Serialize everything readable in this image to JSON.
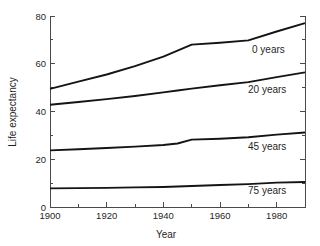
{
  "chart_data": {
    "type": "line",
    "title": "",
    "xlabel": "Year",
    "ylabel": "Life expectancy",
    "xlim": [
      1900,
      1990
    ],
    "ylim": [
      0,
      80
    ],
    "grid": false,
    "legend_position": "inline-right",
    "x_ticks_major": [
      1900,
      1920,
      1940,
      1960,
      1980
    ],
    "x_tick_labels": [
      "1900",
      "1920",
      "1940",
      "1960",
      "1980"
    ],
    "x_ticks_minor": [
      1910,
      1930,
      1950,
      1970,
      1990
    ],
    "y_ticks_major": [
      0,
      20,
      40,
      60,
      80
    ],
    "y_tick_labels": [
      "0",
      "20",
      "40",
      "60",
      "80"
    ],
    "y_ticks_minor": [
      10,
      30,
      50,
      70
    ],
    "x": [
      1900,
      1910,
      1920,
      1930,
      1940,
      1945,
      1950,
      1960,
      1970,
      1980,
      1990
    ],
    "series": [
      {
        "name": "0 years",
        "label": "0 years",
        "values": [
          49.5,
          52.5,
          55.5,
          59.0,
          63.0,
          65.5,
          68.0,
          68.8,
          69.8,
          73.5,
          77.0
        ]
      },
      {
        "name": "20 years",
        "label": "20 years",
        "values": [
          42.8,
          44.0,
          45.2,
          46.5,
          48.0,
          48.8,
          49.6,
          51.0,
          52.3,
          54.4,
          56.4
        ]
      },
      {
        "name": "45 years",
        "label": "45 years",
        "values": [
          23.7,
          24.2,
          24.7,
          25.3,
          26.0,
          26.6,
          28.2,
          28.6,
          29.2,
          30.3,
          31.2
        ]
      },
      {
        "name": "75 years",
        "label": "75 years",
        "values": [
          7.8,
          7.9,
          8.0,
          8.2,
          8.4,
          8.6,
          8.8,
          9.2,
          9.6,
          10.2,
          10.5
        ]
      }
    ],
    "axis_color": "#4a4a4a",
    "line_color": "#141414",
    "background_color": "#ffffff"
  },
  "labels": {
    "series_0": "0 years",
    "series_20": "20 years",
    "series_45": "45 years",
    "series_75": "75 years",
    "x_axis_title": "Year",
    "y_axis_title": "Life expectancy",
    "y_0": "0",
    "y_20": "20",
    "y_40": "40",
    "y_60": "60",
    "y_80": "80",
    "x_1900": "1900",
    "x_1920": "1920",
    "x_1940": "1940",
    "x_1960": "1960",
    "x_1980": "1980"
  }
}
